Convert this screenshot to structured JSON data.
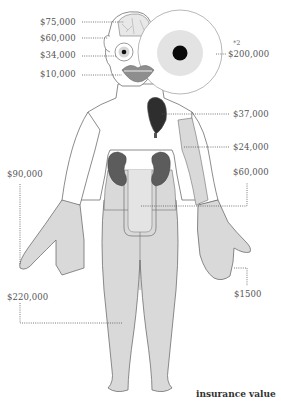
{
  "title": "insurance value",
  "footnote_marker": "*2",
  "colors": {
    "skin": "#d9d9d9",
    "outline": "#6e6e6e",
    "organ": "#5c5c5c",
    "leader": "#555555",
    "text": "#555555"
  },
  "labels": {
    "brain": "$75,000",
    "ear": "$60,000",
    "eye": "$34,000",
    "lips": "$10,000",
    "eye_pair": "$200,000",
    "heart": "$37,000",
    "arm": "$24,000",
    "kidneys": "$60,000",
    "right_hand": "$90,000",
    "finger": "$1500",
    "legs": "$220,000"
  }
}
